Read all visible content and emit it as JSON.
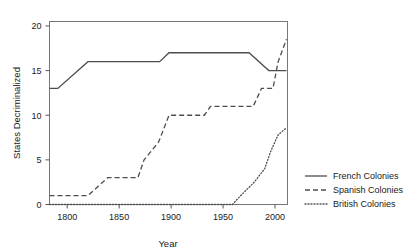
{
  "chart_data": {
    "type": "line",
    "title": "",
    "xlabel": "Year",
    "ylabel": "States Decriminalized",
    "xlim": [
      1783,
      2012
    ],
    "ylim": [
      0,
      20.5
    ],
    "xticks": [
      1800,
      1850,
      1900,
      1950,
      2000
    ],
    "xticklabels": [
      "1800",
      "1850",
      "1900",
      "1950",
      "2000"
    ],
    "yticks": [
      0,
      5,
      10,
      15,
      20
    ],
    "yticklabels": [
      "0",
      "5",
      "10",
      "15",
      "20"
    ],
    "grid": false,
    "legend_position": "right-outside",
    "series": [
      {
        "name": "French Colonies",
        "style": "solid",
        "color": "#4d4d4d",
        "points": [
          [
            1783,
            13
          ],
          [
            1791,
            13
          ],
          [
            1820,
            16
          ],
          [
            1889,
            16
          ],
          [
            1898,
            17
          ],
          [
            1975,
            17
          ],
          [
            1994,
            15
          ],
          [
            2011,
            15
          ]
        ]
      },
      {
        "name": "Spanish Colonies",
        "style": "dashed",
        "color": "#4d4d4d",
        "points": [
          [
            1783,
            1
          ],
          [
            1820,
            1
          ],
          [
            1839,
            3
          ],
          [
            1868,
            3
          ],
          [
            1874,
            5
          ],
          [
            1888,
            7
          ],
          [
            1898,
            10
          ],
          [
            1932,
            10
          ],
          [
            1938,
            11
          ],
          [
            1979,
            11
          ],
          [
            1987,
            13
          ],
          [
            1998,
            13
          ],
          [
            2003,
            16
          ],
          [
            2011,
            18.5
          ]
        ]
      },
      {
        "name": "British Colonies",
        "style": "dotted",
        "color": "#4d4d4d",
        "points": [
          [
            1783,
            0
          ],
          [
            1959,
            0
          ],
          [
            1967,
            1
          ],
          [
            1980,
            2.5
          ],
          [
            1990,
            4
          ],
          [
            1996,
            6
          ],
          [
            2003,
            7.8
          ],
          [
            2011,
            8.6
          ]
        ]
      }
    ]
  },
  "legend": {
    "items": [
      {
        "label": "French Colonies",
        "style": "solid"
      },
      {
        "label": "Spanish Colonies",
        "style": "dashed"
      },
      {
        "label": "British Colonies",
        "style": "dotted"
      }
    ]
  }
}
